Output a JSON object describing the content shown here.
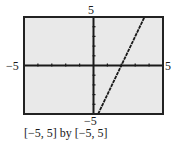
{
  "chart_data": {
    "type": "line",
    "title": "",
    "function": "y = 3x - 6",
    "series": [
      {
        "name": "graph",
        "x": [
          0.333,
          2,
          3.667
        ],
        "y": [
          -5,
          0,
          5
        ]
      }
    ],
    "xlim": [
      -5,
      5
    ],
    "ylim": [
      -5,
      5
    ],
    "xscale_ticks": 1,
    "yscale_ticks": 1,
    "tick_labels": {
      "x_min": "−5",
      "x_max": "5",
      "y_min": "−5",
      "y_max": "5"
    },
    "grid": false,
    "legend": null,
    "window_caption": "[−5, 5] by [−5, 5]"
  },
  "labels": {
    "y_max": "5",
    "y_min": "−5",
    "x_min": "−5",
    "x_max": "5",
    "caption": "[−5, 5] by [−5, 5]"
  },
  "colors": {
    "plot_background": "#e9e9e9",
    "frame": "#222222",
    "axes": "#1a1a1a",
    "curve": "#1a1a1a"
  }
}
